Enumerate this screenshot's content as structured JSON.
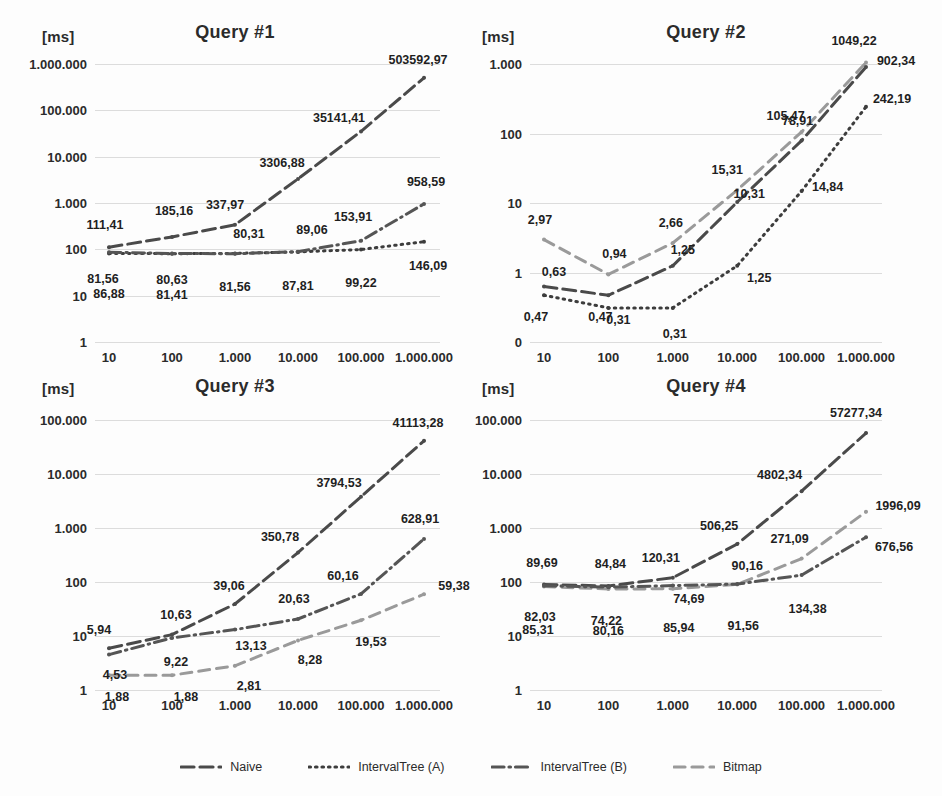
{
  "figure": {
    "unit_label": "[ms]",
    "series_names": [
      "Naive",
      "IntervalTree (A)",
      "IntervalTree (B)",
      "Bitmap"
    ],
    "colors": {
      "naive": "#4a4a4a",
      "intervaltree_a": "#3d3d3d",
      "intervaltree_b": "#555555",
      "bitmap": "#9a9a9a",
      "gridline": "#dcdcdc",
      "text": "#2b2b2b"
    },
    "legend": {
      "position": "bottom-center",
      "items": [
        {
          "label": "Naive",
          "dash": "long-dash"
        },
        {
          "label": "IntervalTree (A)",
          "dash": "dotted"
        },
        {
          "label": "IntervalTree (B)",
          "dash": "dash-dot"
        },
        {
          "label": "Bitmap",
          "dash": "dash"
        }
      ]
    }
  },
  "chart_data": [
    {
      "type": "line",
      "title": "Query #1",
      "xlabel": "",
      "ylabel": "[ms]",
      "xscale": "log",
      "yscale": "log",
      "grid": true,
      "x": [
        10,
        100,
        1000,
        10000,
        100000,
        1000000
      ],
      "xticks": [
        "10",
        "100",
        "1.000",
        "10.000",
        "100.000",
        "1.000.000"
      ],
      "yticks": [
        "1.000.000",
        "100.000",
        "10.000",
        "1.000",
        "100",
        "10",
        "1"
      ],
      "ylim": [
        1,
        1000000
      ],
      "series": [
        {
          "name": "Naive",
          "values": [
            111.41,
            185.16,
            337.97,
            3306.88,
            35141.41,
            503592.97
          ],
          "labels": [
            "111,41",
            "185,16",
            "337,97",
            "3306,88",
            "35141,41",
            "503592,97"
          ]
        },
        {
          "name": "IntervalTree (A)",
          "values": [
            81.56,
            80.63,
            81.56,
            87.81,
            99.22,
            146.09
          ],
          "labels": [
            "81,56",
            "80,63",
            "81,56",
            "87,81",
            "99,22",
            "146,09"
          ]
        },
        {
          "name": "IntervalTree (B)",
          "values": [
            86.88,
            81.41,
            80.31,
            89.06,
            153.91,
            958.59
          ],
          "labels": [
            "86,88",
            "81,41",
            "80,31",
            "89,06",
            "153,91",
            "958,59"
          ]
        }
      ]
    },
    {
      "type": "line",
      "title": "Query #2",
      "xlabel": "",
      "ylabel": "[ms]",
      "xscale": "log",
      "yscale": "log",
      "grid": true,
      "x": [
        10,
        100,
        1000,
        10000,
        100000,
        1000000
      ],
      "xticks": [
        "10",
        "100",
        "1.000",
        "10.000",
        "100.000",
        "1.000.000"
      ],
      "yticks": [
        "1.000",
        "100",
        "10",
        "1",
        "0"
      ],
      "ylim": [
        0.2,
        1000
      ],
      "series": [
        {
          "name": "Bitmap",
          "values": [
            2.97,
            0.94,
            2.66,
            15.31,
            105.47,
            1049.22
          ],
          "labels": [
            "2,97",
            "0,94",
            "2,66",
            "15,31",
            "105,47",
            "1049,22"
          ]
        },
        {
          "name": "Naive",
          "values": [
            0.63,
            0.47,
            1.25,
            10.31,
            78.91,
            902.34
          ],
          "labels": [
            "0,63",
            "0,47",
            "1,25",
            "10,31",
            "78,91",
            "902,34"
          ]
        },
        {
          "name": "IntervalTree (A)",
          "values": [
            0.47,
            0.31,
            0.31,
            1.25,
            14.84,
            242.19
          ],
          "labels": [
            "0,47",
            "0,31",
            "0,31",
            "1,25",
            "14,84",
            "242,19"
          ]
        }
      ]
    },
    {
      "type": "line",
      "title": "Query #3",
      "xlabel": "",
      "ylabel": "[ms]",
      "xscale": "log",
      "yscale": "log",
      "grid": true,
      "x": [
        10,
        100,
        1000,
        10000,
        100000,
        1000000
      ],
      "xticks": [
        "10",
        "100",
        "1.000",
        "10.000",
        "100.000",
        "1.000.000"
      ],
      "yticks": [
        "100.000",
        "10.000",
        "1.000",
        "100",
        "10",
        "1"
      ],
      "ylim": [
        1,
        100000
      ],
      "series": [
        {
          "name": "Naive",
          "values": [
            5.94,
            10.63,
            39.06,
            350.78,
            3794.53,
            41113.28
          ],
          "labels": [
            "5,94",
            "10,63",
            "39,06",
            "350,78",
            "3794,53",
            "41113,28"
          ]
        },
        {
          "name": "IntervalTree (B)",
          "values": [
            4.53,
            9.22,
            13.13,
            20.63,
            60.16,
            628.91
          ],
          "labels": [
            "4,53",
            "9,22",
            "13,13",
            "20,63",
            "60,16",
            "628,91"
          ]
        },
        {
          "name": "Bitmap",
          "values": [
            1.88,
            1.88,
            2.81,
            8.28,
            19.53,
            59.38
          ],
          "labels": [
            "1,88",
            "1,88",
            "2,81",
            "8,28",
            "19,53",
            "59,38"
          ]
        }
      ]
    },
    {
      "type": "line",
      "title": "Query #4",
      "xlabel": "",
      "ylabel": "[ms]",
      "xscale": "log",
      "yscale": "log",
      "grid": true,
      "x": [
        10,
        100,
        1000,
        10000,
        100000,
        1000000
      ],
      "xticks": [
        "10",
        "100",
        "1.000",
        "10.000",
        "100.000",
        "1.000.000"
      ],
      "yticks": [
        "100.000",
        "10.000",
        "1.000",
        "100",
        "10",
        "1"
      ],
      "ylim": [
        1,
        100000
      ],
      "series": [
        {
          "name": "Naive",
          "values": [
            89.69,
            84.84,
            120.31,
            506.25,
            4802.34,
            57277.34
          ],
          "labels": [
            "89,69",
            "84,84",
            "120,31",
            "506,25",
            "4802,34",
            "57277,34"
          ]
        },
        {
          "name": "Bitmap",
          "values": [
            82.03,
            74.22,
            74.69,
            90.16,
            271.09,
            1996.09
          ],
          "labels": [
            "82,03",
            "74,22",
            "74,69",
            "90,16",
            "271,09",
            "1996,09"
          ]
        },
        {
          "name": "IntervalTree (B)",
          "values": [
            85.31,
            80.16,
            85.94,
            91.56,
            134.38,
            676.56
          ],
          "labels": [
            "85,31",
            "80,16",
            "85,94",
            "91,56",
            "134,38",
            "676,56"
          ]
        }
      ]
    }
  ]
}
